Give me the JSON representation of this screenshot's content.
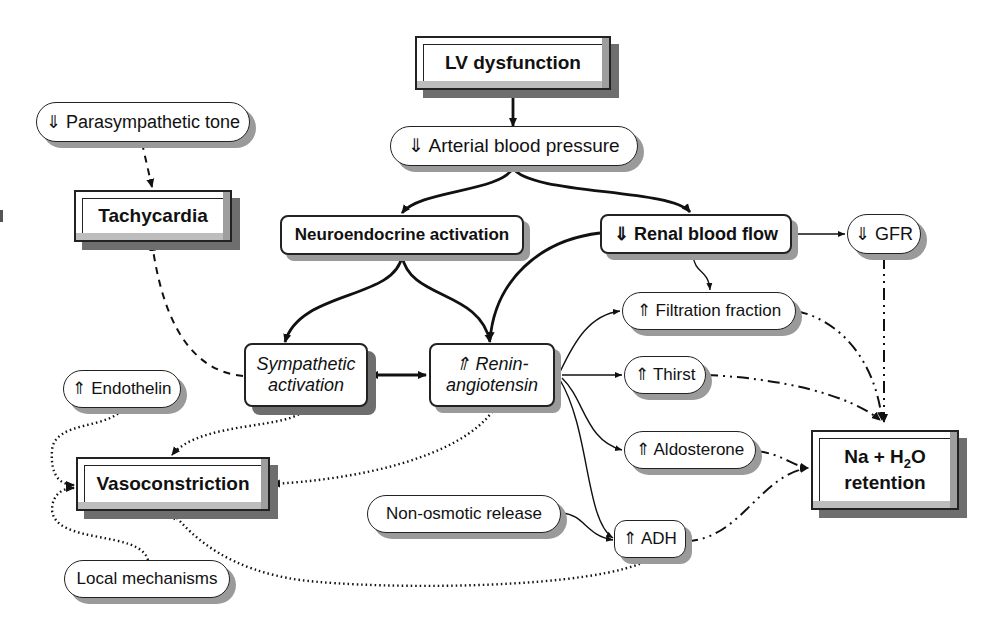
{
  "diagram": {
    "nodes": {
      "lv_dysfunction": "LV dysfunction",
      "arterial_bp": "⇓ Arterial blood pressure",
      "parasympathetic": "⇓ Parasympathetic tone",
      "tachycardia": "Tachycardia",
      "neuroendocrine": "Neuroendocrine activation",
      "renal_blood_flow": "⇓ Renal blood flow",
      "gfr": "⇓ GFR",
      "filtration_fraction": "⇑ Filtration fraction",
      "sympathetic_line1": "Sympathetic",
      "sympathetic_line2": "activation",
      "renin_line1": "⇑ Renin-",
      "renin_line2": "angiotensin",
      "thirst": "⇑ Thirst",
      "aldosterone": "⇑ Aldosterone",
      "endothelin": "⇑ Endothelin",
      "vasoconstriction": "Vasoconstriction",
      "na_h2o_line1_a": "Na + H",
      "na_h2o_sub": "2",
      "na_h2o_line1_b": "O",
      "na_h2o_line2": "retention",
      "non_osmotic": "Non-osmotic release",
      "adh": "⇑ ADH",
      "local_mechanisms": "Local mechanisms"
    },
    "edges": [
      {
        "from": "LV dysfunction",
        "to": "⇓ Arterial blood pressure",
        "style": "solid-bold"
      },
      {
        "from": "⇓ Arterial blood pressure",
        "to": "Neuroendocrine activation",
        "style": "solid-bold"
      },
      {
        "from": "⇓ Arterial blood pressure",
        "to": "⇓ Renal blood flow",
        "style": "solid-bold"
      },
      {
        "from": "⇓ Parasympathetic tone",
        "to": "Tachycardia",
        "style": "dashed"
      },
      {
        "from": "Sympathetic activation",
        "to": "Tachycardia",
        "style": "dashed"
      },
      {
        "from": "Neuroendocrine activation",
        "to": "Sympathetic activation",
        "style": "solid-bold"
      },
      {
        "from": "Neuroendocrine activation",
        "to": "⇑ Renin-angiotensin",
        "style": "solid-bold"
      },
      {
        "from": "⇓ Renal blood flow",
        "to": "⇑ Renin-angiotensin",
        "style": "solid-bold"
      },
      {
        "from": "Sympathetic activation",
        "to": "⇑ Renin-angiotensin",
        "style": "bidirectional-bold"
      },
      {
        "from": "⇓ Renal blood flow",
        "to": "⇓ GFR",
        "style": "solid-thin"
      },
      {
        "from": "⇓ Renal blood flow",
        "to": "⇑ Filtration fraction",
        "style": "solid-thin"
      },
      {
        "from": "⇑ Renin-angiotensin",
        "to": "⇑ Filtration fraction",
        "style": "solid-thin"
      },
      {
        "from": "⇑ Renin-angiotensin",
        "to": "⇑ Thirst",
        "style": "solid-thin"
      },
      {
        "from": "⇑ Renin-angiotensin",
        "to": "⇑ Aldosterone",
        "style": "solid-thin"
      },
      {
        "from": "⇑ Renin-angiotensin",
        "to": "⇑ ADH",
        "style": "solid-thin"
      },
      {
        "from": "Non-osmotic release",
        "to": "⇑ ADH",
        "style": "solid-thin"
      },
      {
        "from": "⇓ GFR",
        "to": "Na + H2O retention",
        "style": "dash-dot"
      },
      {
        "from": "⇑ Filtration fraction",
        "to": "Na + H2O retention",
        "style": "dash-dot"
      },
      {
        "from": "⇑ Thirst",
        "to": "Na + H2O retention",
        "style": "dash-dot"
      },
      {
        "from": "⇑ Aldosterone",
        "to": "Na + H2O retention",
        "style": "dash-dot"
      },
      {
        "from": "⇑ ADH",
        "to": "Na + H2O retention",
        "style": "dash-dot"
      },
      {
        "from": "Sympathetic activation",
        "to": "Vasoconstriction",
        "style": "dotted"
      },
      {
        "from": "⇑ Renin-angiotensin",
        "to": "Vasoconstriction",
        "style": "dotted"
      },
      {
        "from": "⇑ Endothelin",
        "to": "Vasoconstriction",
        "style": "dotted"
      },
      {
        "from": "Local mechanisms",
        "to": "Vasoconstriction",
        "style": "dotted"
      },
      {
        "from": "⇑ ADH",
        "to": "Vasoconstriction",
        "style": "dotted"
      }
    ],
    "colors": {
      "ink": "#111111",
      "shadow": "#9a9a9a",
      "shadow_dark": "#6e6e6e",
      "background": "#ffffff"
    }
  }
}
